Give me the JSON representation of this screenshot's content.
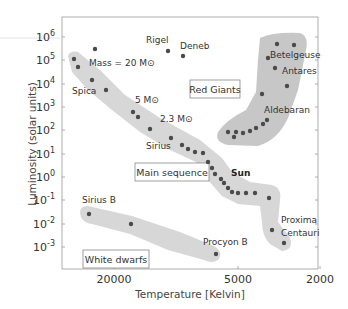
{
  "chart_data": {
    "type": "scatter",
    "title": "",
    "xlabel": "Temperature [Kelvin]",
    "ylabel": "Luminosity (solar units)",
    "x_scale": "log (reversed)",
    "y_scale": "log",
    "x_ticks": [
      {
        "value": 20000,
        "label": "20000",
        "px": 114
      },
      {
        "value": 5000,
        "label": "5000",
        "px": 238
      },
      {
        "value": 2000,
        "label": "2000",
        "px": 320
      }
    ],
    "y_ticks": [
      {
        "exp": "6",
        "px": 37
      },
      {
        "exp": "5",
        "px": 60
      },
      {
        "exp": "4",
        "px": 84
      },
      {
        "exp": "3",
        "px": 107
      },
      {
        "exp": "2",
        "px": 130
      },
      {
        "exp": "1",
        "px": 154
      },
      {
        "exp": "0",
        "px": 177
      },
      {
        "exp": "-1",
        "px": 200
      },
      {
        "exp": "-2",
        "px": 224
      },
      {
        "exp": "-3",
        "px": 247
      }
    ],
    "y_tick_base": "10",
    "xlim": [
      30000,
      2000
    ],
    "ylim": [
      0.0001,
      10000000
    ],
    "grid": false,
    "regions": [
      {
        "name": "Main sequence",
        "box": {
          "x": 135,
          "y": 163,
          "w": 74,
          "h": 18
        }
      },
      {
        "name": "Red Giants",
        "box": {
          "x": 190,
          "y": 80,
          "w": 50,
          "h": 18
        }
      },
      {
        "name": "White dwarfs",
        "box": {
          "x": 83,
          "y": 250,
          "w": 66,
          "h": 18
        }
      }
    ],
    "series": [
      {
        "name": "Main sequence",
        "points_px": [
          [
            74,
            59
          ],
          [
            78,
            67
          ],
          [
            92,
            80
          ],
          [
            106,
            90
          ],
          [
            133,
            112
          ],
          [
            138,
            117
          ],
          [
            150,
            129
          ],
          [
            171,
            138
          ],
          [
            182,
            145
          ],
          [
            188,
            149
          ],
          [
            195,
            152
          ],
          [
            203,
            153
          ],
          [
            208,
            162
          ],
          [
            212,
            168
          ],
          [
            215,
            174
          ],
          [
            221,
            179
          ],
          [
            224,
            183
          ],
          [
            228,
            188
          ],
          [
            232,
            192
          ],
          [
            238,
            193
          ],
          [
            246,
            193
          ],
          [
            255,
            193
          ],
          [
            269,
            198
          ],
          [
            272,
            230
          ],
          [
            284,
            243
          ]
        ]
      },
      {
        "name": "Red giants",
        "points_px": [
          [
            277,
            44
          ],
          [
            294,
            45
          ],
          [
            268,
            58
          ],
          [
            275,
            68
          ],
          [
            287,
            86
          ],
          [
            262,
            94
          ],
          [
            267,
            120
          ],
          [
            263,
            124
          ],
          [
            256,
            128
          ],
          [
            250,
            131
          ],
          [
            243,
            133
          ],
          [
            234,
            137
          ],
          [
            228,
            132
          ],
          [
            236,
            132
          ]
        ]
      },
      {
        "name": "White dwarfs",
        "points_px": [
          [
            89,
            214
          ],
          [
            131,
            224
          ],
          [
            216,
            254
          ]
        ]
      },
      {
        "name": "Supergiants",
        "points_px": [
          [
            95,
            49
          ],
          [
            168,
            51
          ],
          [
            183,
            56
          ]
        ]
      }
    ],
    "annotations": [
      {
        "text": "Rigel",
        "x": 146,
        "y": 43,
        "bold": false
      },
      {
        "text": "Deneb",
        "x": 180,
        "y": 49,
        "bold": false
      },
      {
        "text": "Mass = 20 M⊙",
        "x": 89,
        "y": 66,
        "bold": false
      },
      {
        "text": "Spica",
        "x": 72,
        "y": 94,
        "bold": false
      },
      {
        "text": "5 M⊙",
        "x": 135,
        "y": 103,
        "bold": false
      },
      {
        "text": "2.3 M⊙",
        "x": 160,
        "y": 122,
        "bold": false
      },
      {
        "text": "Sirius",
        "x": 146,
        "y": 149,
        "bold": false
      },
      {
        "text": "Sun",
        "x": 231,
        "y": 176,
        "bold": true
      },
      {
        "text": "Betelgeuse",
        "x": 270,
        "y": 58,
        "bold": false
      },
      {
        "text": "Antares",
        "x": 282,
        "y": 74,
        "bold": false
      },
      {
        "text": "Aldebaran",
        "x": 264,
        "y": 113,
        "bold": false
      },
      {
        "text": "Sirius B",
        "x": 82,
        "y": 203,
        "bold": false
      },
      {
        "text": "Procyon B",
        "x": 203,
        "y": 245,
        "bold": false
      },
      {
        "text": "Proxima",
        "x": 281,
        "y": 223,
        "bold": false
      },
      {
        "text": "Centauri",
        "x": 281,
        "y": 236,
        "bold": false
      }
    ],
    "colors": {
      "dot": "#4a4a4a",
      "band": "#d0d0d0",
      "red_giant_band": "#bdbdbd",
      "frame": "#9a9a9a"
    }
  }
}
